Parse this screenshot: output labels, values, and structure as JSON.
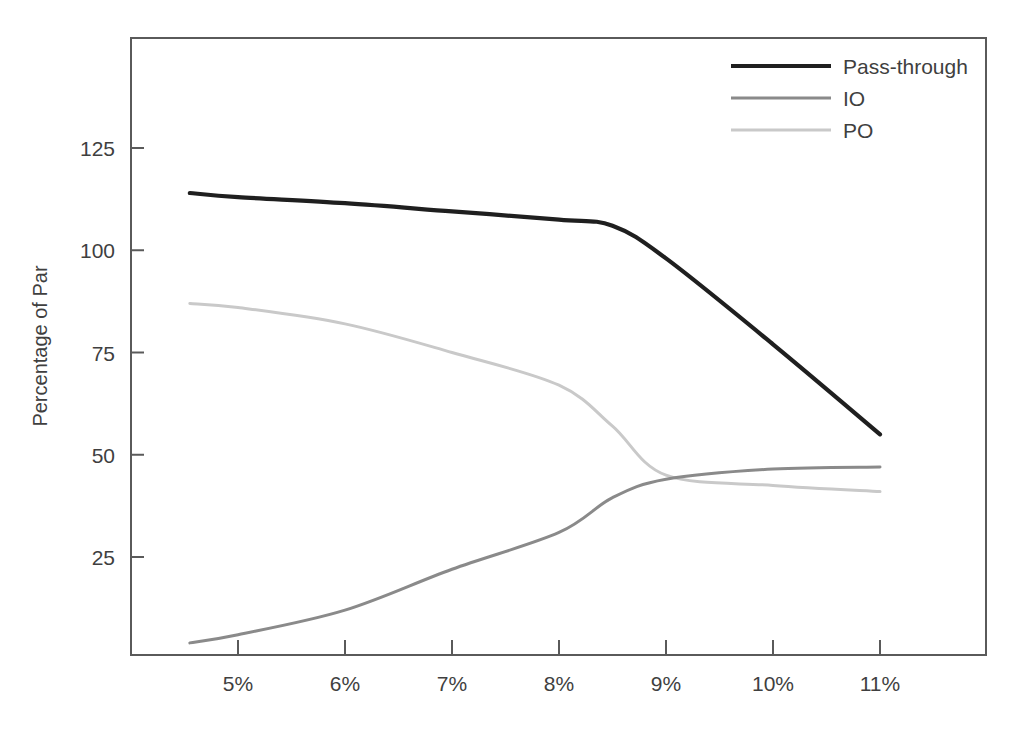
{
  "chart_data": {
    "type": "line",
    "title": "",
    "subtitle": "",
    "xlabel": "",
    "ylabel": "Percentage of Par",
    "x": [
      4.55,
      5,
      6,
      7,
      8,
      8.5,
      9,
      10,
      11
    ],
    "xtick_labels": [
      "5%",
      "6%",
      "7%",
      "8%",
      "9%",
      "10%",
      "11%"
    ],
    "xtick_values": [
      5,
      6,
      7,
      8,
      9,
      10,
      11
    ],
    "ytick_labels": [
      "125",
      "100",
      "75",
      "50",
      "25"
    ],
    "ytick_values": [
      125,
      100,
      75,
      50,
      25
    ],
    "xlim": [
      4.55,
      11.4
    ],
    "ylim": [
      0,
      149
    ],
    "grid": false,
    "legend_position": "top-right",
    "series": [
      {
        "name": "Pass-through",
        "color": "#1f1f1f",
        "width": 4.2,
        "values": [
          114,
          113,
          111.5,
          109.5,
          107.5,
          106,
          98,
          77,
          55
        ]
      },
      {
        "name": "IO",
        "color": "#8a8a8a",
        "width": 3.0,
        "values": [
          4,
          6,
          12,
          22,
          31,
          39.5,
          44,
          46.5,
          47
        ]
      },
      {
        "name": "PO",
        "color": "#c9c9c9",
        "width": 3.0,
        "values": [
          87,
          86,
          82,
          75,
          67,
          57,
          45,
          42.5,
          41
        ]
      }
    ],
    "annotations": []
  },
  "legend": {
    "items": [
      {
        "label": "Pass-through"
      },
      {
        "label": "IO"
      },
      {
        "label": "PO"
      }
    ]
  },
  "axes": {
    "y_title": "Percentage of Par"
  }
}
